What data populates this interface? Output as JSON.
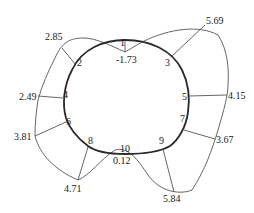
{
  "diagram": {
    "type": "tunnel-section-stress-distribution",
    "colors": {
      "section": "#2a2a2a",
      "envelope": "#555555",
      "text": "#1a1a1a"
    },
    "points": [
      {
        "id": "1",
        "label": "1",
        "value": "-1.73"
      },
      {
        "id": "2",
        "label": "2",
        "value": "2.85"
      },
      {
        "id": "3",
        "label": "3",
        "value": "5.69"
      },
      {
        "id": "4",
        "label": "4",
        "value": "2.49"
      },
      {
        "id": "5",
        "label": "5",
        "value": "4.15"
      },
      {
        "id": "6",
        "label": "6",
        "value": "3.81"
      },
      {
        "id": "7",
        "label": "7",
        "value": "3.67"
      },
      {
        "id": "8",
        "label": "8",
        "value": "4.71"
      },
      {
        "id": "9",
        "label": "9",
        "value": "5.84"
      },
      {
        "id": "10",
        "label": "10",
        "value": "0.12"
      }
    ]
  }
}
